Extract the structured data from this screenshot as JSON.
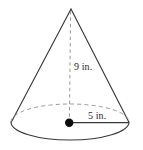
{
  "figure": {
    "name": "cone-diagram",
    "shape": "cone",
    "background_color": "#ffffff",
    "width": 143,
    "height": 150,
    "labels": {
      "height": "9 in.",
      "radius": "5 in."
    },
    "measurements": [
      {
        "name": "height",
        "value": 9,
        "unit": "in.",
        "text": "9 in."
      },
      {
        "name": "radius",
        "value": 5,
        "unit": "in.",
        "text": "5 in."
      }
    ],
    "colors": {
      "outline": "#3a3a3a",
      "dashed": "#8f8f8f",
      "center_dot": "#0d0d0d",
      "text": "#2b2b2b"
    },
    "geometry": {
      "apex": {
        "x": 71,
        "y": 9
      },
      "base_center": {
        "x": 70,
        "y": 122
      },
      "base_rx": 59,
      "base_ry": 18,
      "radius_line_end": {
        "x": 129,
        "y": 122
      },
      "center_dot_radius": 4.2
    }
  }
}
